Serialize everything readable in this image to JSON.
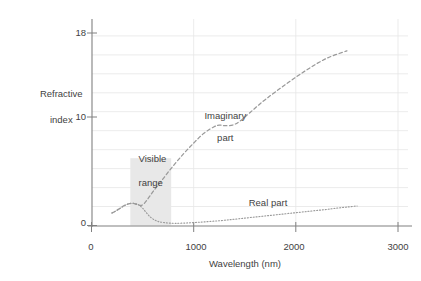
{
  "chart_data": {
    "type": "line",
    "title": "",
    "xlabel": "Wavelength (nm)",
    "ylabel": "Refractive\nindex",
    "ylabel_line1": "Refractive",
    "ylabel_line2": "index",
    "xlim": [
      0,
      3000
    ],
    "ylim": [
      0,
      19.6
    ],
    "xticks": [
      0,
      1000,
      2000,
      3000
    ],
    "xtick_labels": [
      "0",
      "1000",
      "2000",
      "3000"
    ],
    "yticks": [
      0,
      10,
      18
    ],
    "ytick_labels": [
      "0",
      "10",
      "18"
    ],
    "grid": "horizontal-and-vertical-light",
    "legend_position": "inline-annotations",
    "annotations": [
      {
        "name": "imaginary-part",
        "line1": "Imaginary",
        "line2": "part",
        "x": 1150,
        "y": 11.6
      },
      {
        "name": "real-part",
        "text": "Real part",
        "x": 1820,
        "y": 2.4
      },
      {
        "name": "visible-range",
        "line1": "Visible",
        "line2": "range",
        "x": 420,
        "y": 7.4
      }
    ],
    "shaded_regions": [
      {
        "name": "visible-range-band",
        "x0": 380,
        "x1": 780,
        "y0": 0,
        "y1": 6.2,
        "color": "#e8e8e8"
      }
    ],
    "series": [
      {
        "name": "Imaginary part",
        "style": "dashed",
        "color": "#9a9a9a",
        "points": [
          [
            200,
            1.15
          ],
          [
            240,
            1.35
          ],
          [
            280,
            1.6
          ],
          [
            320,
            1.85
          ],
          [
            360,
            2.0
          ],
          [
            400,
            2.05
          ],
          [
            440,
            1.95
          ],
          [
            470,
            1.85
          ],
          [
            500,
            1.9
          ],
          [
            540,
            2.3
          ],
          [
            600,
            3.1
          ],
          [
            700,
            4.3
          ],
          [
            800,
            5.5
          ],
          [
            900,
            6.6
          ],
          [
            1000,
            7.6
          ],
          [
            1100,
            8.5
          ],
          [
            1200,
            9.1
          ],
          [
            1250,
            9.25
          ],
          [
            1300,
            9.2
          ],
          [
            1380,
            9.25
          ],
          [
            1450,
            9.6
          ],
          [
            1550,
            10.4
          ],
          [
            1700,
            11.6
          ],
          [
            1900,
            13.0
          ],
          [
            2100,
            14.3
          ],
          [
            2300,
            15.4
          ],
          [
            2500,
            16.1
          ]
        ]
      },
      {
        "name": "Real part",
        "style": "dotted",
        "color": "#9a9a9a",
        "points": [
          [
            200,
            1.15
          ],
          [
            250,
            1.4
          ],
          [
            300,
            1.7
          ],
          [
            350,
            1.95
          ],
          [
            400,
            2.05
          ],
          [
            440,
            2.0
          ],
          [
            470,
            1.85
          ],
          [
            500,
            1.6
          ],
          [
            540,
            1.15
          ],
          [
            580,
            0.75
          ],
          [
            620,
            0.5
          ],
          [
            660,
            0.35
          ],
          [
            700,
            0.28
          ],
          [
            760,
            0.22
          ],
          [
            820,
            0.2
          ],
          [
            900,
            0.22
          ],
          [
            1000,
            0.27
          ],
          [
            1100,
            0.33
          ],
          [
            1200,
            0.4
          ],
          [
            1300,
            0.48
          ],
          [
            1400,
            0.58
          ],
          [
            1500,
            0.68
          ],
          [
            1600,
            0.78
          ],
          [
            1700,
            0.88
          ],
          [
            1800,
            0.98
          ],
          [
            1900,
            1.08
          ],
          [
            2000,
            1.18
          ],
          [
            2100,
            1.28
          ],
          [
            2200,
            1.38
          ],
          [
            2300,
            1.48
          ],
          [
            2400,
            1.6
          ],
          [
            2500,
            1.7
          ],
          [
            2600,
            1.8
          ]
        ]
      }
    ]
  },
  "axes": {
    "x_title": "Wavelength (nm)",
    "y_title_line1": "Refractive",
    "y_title_line2": "index",
    "xtick_0": "0",
    "xtick_1000": "1000",
    "xtick_2000": "2000",
    "xtick_3000": "3000",
    "ytick_0": "0",
    "ytick_10": "10",
    "ytick_18": "18"
  },
  "labels": {
    "imaginary_line1": "Imaginary",
    "imaginary_line2": "part",
    "real_part": "Real part",
    "visible_line1": "Visible",
    "visible_line2": "range"
  },
  "colors": {
    "axis": "#808080",
    "grid": "#e6e6e6",
    "curve": "#9a9a9a",
    "band": "#e8e8e8",
    "text": "#3f3f3f",
    "background": "#ffffff"
  }
}
